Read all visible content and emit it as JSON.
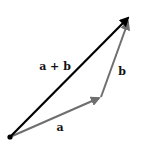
{
  "diagram": {
    "colors": {
      "background": "#ffffff",
      "resultant": "#000000",
      "component": "#6e6e6e",
      "label": "#111111"
    },
    "origin": {
      "x": 10,
      "y": 137
    },
    "vectors": [
      {
        "id": "a",
        "label": "a",
        "from": [
          10,
          137
        ],
        "to": [
          101,
          97
        ],
        "color": "#6e6e6e",
        "label_pos": [
          60,
          131
        ]
      },
      {
        "id": "b",
        "label": "b",
        "from": [
          101,
          97
        ],
        "to": [
          129,
          19
        ],
        "color": "#6e6e6e",
        "label_pos": [
          122,
          75
        ]
      },
      {
        "id": "sum",
        "label": "a + b",
        "from": [
          10,
          137
        ],
        "to": [
          131,
          15
        ],
        "color": "#000000",
        "label_pos": [
          55,
          70
        ]
      }
    ]
  }
}
